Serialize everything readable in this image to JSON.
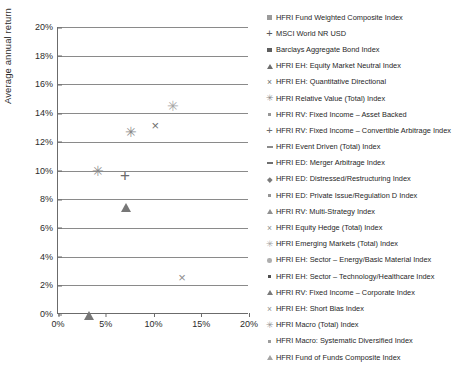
{
  "chart_data": {
    "type": "scatter",
    "title": "",
    "xlabel": "",
    "ylabel": "Average annual return",
    "xlim": [
      0,
      20
    ],
    "ylim": [
      0,
      20
    ],
    "xticks": [
      "0%",
      "5%",
      "10%",
      "15%",
      "20%"
    ],
    "xtick_values": [
      0,
      5,
      10,
      15,
      20
    ],
    "yticks": [
      "0%",
      "2%",
      "4%",
      "6%",
      "8%",
      "10%",
      "12%",
      "14%",
      "16%",
      "18%",
      "20%"
    ],
    "ytick_values": [
      0,
      2,
      4,
      6,
      8,
      10,
      12,
      14,
      16,
      18,
      20
    ],
    "grid": "horizontal",
    "legend_position": "right",
    "x_units": "percent",
    "y_units": "percent",
    "points": [
      {
        "label": "HFRI Fund Weighted Composite Index",
        "x": 6.9,
        "y": 11.5,
        "marker": "square",
        "color": "#8f8f8f"
      },
      {
        "label": "MSCI World NR USD",
        "x": 15.6,
        "y": 17.0,
        "marker": "square",
        "color": "#5b5b5b"
      },
      {
        "label": "Barclays Aggregate Bond Index",
        "x": 3.9,
        "y": 7.3,
        "marker": "square",
        "color": "#a2a2a2"
      },
      {
        "label": "HFRI EH: Equity Market Neutral Index",
        "x": 3.2,
        "y": 0.9,
        "marker": "triangle",
        "color": "#777777"
      },
      {
        "label": "HFRI EH: Quantitative Directional",
        "x": 10.2,
        "y": 13.2,
        "marker": "x",
        "color": "#6e6e6e"
      },
      {
        "label": "HFRI Relative Value (Total) Index",
        "x": 4.2,
        "y": 10.0,
        "marker": "asterisk",
        "color": "#8a8a8a"
      },
      {
        "label": "HFRI RV: Fixed Income – Asset Backed",
        "x": 6.8,
        "y": 12.3,
        "marker": "diamond",
        "color": "#6a6a6a"
      },
      {
        "label": "HFRI RV: Fixed Income – Convertible Arbitrage Index",
        "x": 7.0,
        "y": 9.7,
        "marker": "plus",
        "color": "#6b6b6b"
      },
      {
        "label": "HFRI Event Driven (Total) Index",
        "x": 4.0,
        "y": 8.6,
        "marker": "dash",
        "color": "#8b8b8b"
      },
      {
        "label": "HFRI ED: Merger Arbitrage Index",
        "x": 6.9,
        "y": 11.9,
        "marker": "square-small",
        "color": "#6f6f6f"
      },
      {
        "label": "HFRI ED: Distressed/Restructuring Index",
        "x": 13.3,
        "y": 6.7,
        "marker": "diamond",
        "color": "#6a6a6a"
      },
      {
        "label": "HFRI ED: Private Issue/Regulation D Index",
        "x": 7.6,
        "y": 12.7,
        "marker": "asterisk",
        "color": "#8a8a8a"
      },
      {
        "label": "HFRI RV: Multi-Strategy Index",
        "x": 7.1,
        "y": 8.4,
        "marker": "triangle",
        "color": "#777777"
      },
      {
        "label": "HFRI Equity Hedge (Total) Index",
        "x": 13.0,
        "y": 2.6,
        "marker": "x",
        "color": "#8d8d8d"
      },
      {
        "label": "HFRI Emerging Markets (Total) Index",
        "x": 12.0,
        "y": 14.5,
        "marker": "asterisk",
        "color": "#a6a6a6"
      },
      {
        "label": "HFRI EH: Sector – Energy/Basic Material Index",
        "x": 3.8,
        "y": 9.2,
        "marker": "circle",
        "color": "#8e8e8e"
      },
      {
        "label": "HFRI EH: Sector – Technology/Healthcare Index",
        "x": 7.1,
        "y": 11.3,
        "marker": "circle",
        "color": "#b1b1b1"
      },
      {
        "label": "HFRI RV: Fixed Income – Corporate Index",
        "x": 7.0,
        "y": 11.5,
        "marker": "square",
        "color": "#8f8f8f"
      },
      {
        "label": "HFRI EH: Short Bias Index",
        "x": 4.1,
        "y": 8.3,
        "marker": "dash",
        "color": "#8b8b8b"
      },
      {
        "label": "HFRI Macro (Total) Index",
        "x": 4.0,
        "y": 7.4,
        "marker": "square-small",
        "color": "#9a9a9a"
      },
      {
        "label": "HFRI Macro: Systematic Diversified Index",
        "x": 6.9,
        "y": 11.6,
        "marker": "square",
        "color": "#7d7d7d"
      },
      {
        "label": "HFRI Fund of Funds Composite Index",
        "x": 6.9,
        "y": 11.4,
        "marker": "square",
        "color": "#9c9c9c"
      }
    ]
  },
  "axes": {
    "ylabel": "Average annual return",
    "yticks": [
      "20%",
      "18%",
      "16%",
      "14%",
      "12%",
      "10%",
      "8%",
      "6%",
      "4%",
      "2%",
      "0%"
    ],
    "xticks": [
      "0%",
      "5%",
      "10%",
      "15%",
      "20%"
    ]
  },
  "legend": {
    "items": [
      {
        "label": "HFRI Fund Weighted Composite Index",
        "marker": "square",
        "color": "#9b9b9b"
      },
      {
        "label": "MSCI World NR USD",
        "marker": "plus",
        "color": "#595959"
      },
      {
        "label": "Barclays Aggregate Bond Index",
        "marker": "square",
        "color": "#5e5e5e"
      },
      {
        "label": "HFRI EH: Equity Market Neutral Index",
        "marker": "triangle",
        "color": "#6d6d6d"
      },
      {
        "label": "HFRI EH: Quantitative Directional",
        "marker": "x",
        "color": "#6e6e6e"
      },
      {
        "label": "HFRI Relative Value (Total) Index",
        "marker": "asterisk",
        "color": "#8a8a8a"
      },
      {
        "label": "HFRI RV: Fixed Income – Asset Backed",
        "marker": "square-small",
        "color": "#979797"
      },
      {
        "label": "HFRI RV: Fixed Income – Convertible Arbitrage Index",
        "marker": "plus",
        "color": "#6b6b6b"
      },
      {
        "label": "HFRI Event Driven (Total) Index",
        "marker": "dash",
        "color": "#8b8b8b"
      },
      {
        "label": "HFRI ED: Merger Arbitrage Index",
        "marker": "dash",
        "color": "#6f6f6f"
      },
      {
        "label": "HFRI ED: Distressed/Restructuring Index",
        "marker": "diamond",
        "color": "#7b7b7b"
      },
      {
        "label": "HFRI ED: Private Issue/Regulation D Index",
        "marker": "square-small",
        "color": "#959595"
      },
      {
        "label": "HFRI RV: Multi-Strategy Index",
        "marker": "triangle",
        "color": "#909090"
      },
      {
        "label": "HFRI Equity Hedge (Total) Index",
        "marker": "x",
        "color": "#8d8d8d"
      },
      {
        "label": "HFRI Emerging Markets (Total) Index",
        "marker": "asterisk",
        "color": "#a6a6a6"
      },
      {
        "label": "HFRI EH: Sector – Energy/Basic Material Index",
        "marker": "circle",
        "color": "#aeaeae"
      },
      {
        "label": "HFRI EH: Sector – Technology/Healthcare Index",
        "marker": "square-small",
        "color": "#4f4f4f"
      },
      {
        "label": "HFRI RV: Fixed Income – Corporate Index",
        "marker": "triangle",
        "color": "#7a7a7a"
      },
      {
        "label": "HFRI EH: Short Bias Index",
        "marker": "x",
        "color": "#8f8f8f"
      },
      {
        "label": "HFRI Macro (Total) Index",
        "marker": "asterisk",
        "color": "#949494"
      },
      {
        "label": "HFRI Macro: Systematic Diversified Index",
        "marker": "square-small",
        "color": "#9d9d9d"
      },
      {
        "label": "HFRI Fund of Funds Composite Index",
        "marker": "triangle",
        "color": "#a4a4a4"
      }
    ]
  }
}
